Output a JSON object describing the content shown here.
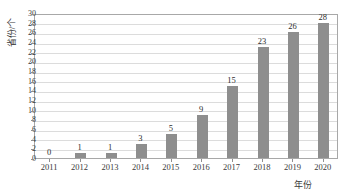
{
  "chart_data": {
    "type": "bar",
    "title": "",
    "subtitle": "",
    "xlabel": "年份",
    "ylabel": "省份/个",
    "categories": [
      "2011",
      "2012",
      "2013",
      "2014",
      "2015",
      "2016",
      "2017",
      "2018",
      "2019",
      "2020"
    ],
    "values": [
      0,
      1,
      1,
      3,
      5,
      9,
      15,
      23,
      26,
      28
    ],
    "value_labels": [
      "0",
      "1",
      "1",
      "3",
      "5",
      "9",
      "15",
      "23",
      "26",
      "28"
    ],
    "ylim": [
      0,
      30
    ],
    "ytick_step": 2,
    "yticks": [
      0,
      2,
      4,
      6,
      8,
      10,
      12,
      14,
      16,
      18,
      20,
      22,
      24,
      26,
      28,
      30
    ],
    "ytick_labels": [
      "0",
      "2",
      "4",
      "6",
      "8",
      "10",
      "12",
      "14",
      "16",
      "18",
      "20",
      "22",
      "24",
      "26",
      "28",
      "30"
    ],
    "grid": true,
    "grid_axis": "y",
    "legend": null,
    "legend_position": "none",
    "bar_color": "#8e8e8e",
    "gridline_color": "#dcdcdc",
    "axis_color": "#a8a8a8",
    "background_color": "#ffffff",
    "text_color": "#3a3a3a"
  }
}
